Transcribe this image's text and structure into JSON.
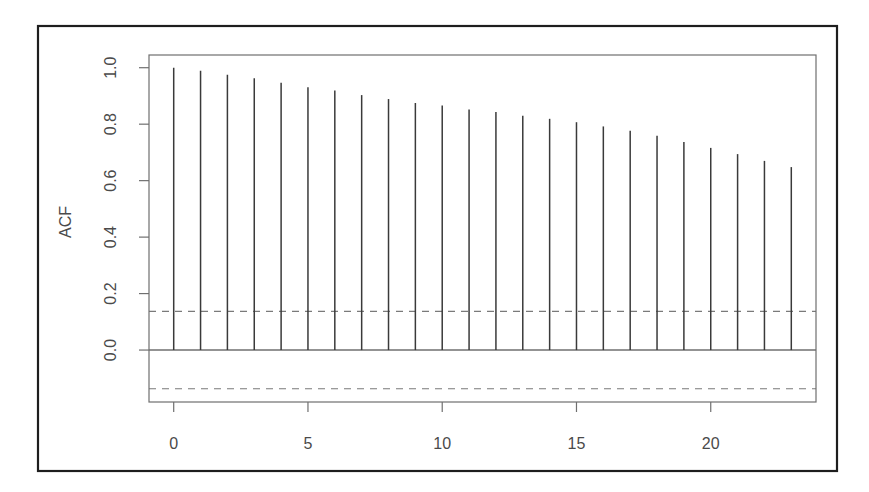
{
  "chart_data": {
    "type": "bar",
    "subtype": "acf-correlogram",
    "title": "",
    "xlabel": "",
    "ylabel": "ACF",
    "x": [
      0,
      1,
      2,
      3,
      4,
      5,
      6,
      7,
      8,
      9,
      10,
      11,
      12,
      13,
      14,
      15,
      16,
      17,
      18,
      19,
      20,
      21,
      22,
      23
    ],
    "values": [
      1.0,
      0.989,
      0.975,
      0.963,
      0.947,
      0.931,
      0.919,
      0.903,
      0.889,
      0.875,
      0.866,
      0.852,
      0.843,
      0.83,
      0.819,
      0.807,
      0.792,
      0.777,
      0.759,
      0.737,
      0.716,
      0.694,
      0.67,
      0.648
    ],
    "confidence_bounds": [
      0.137,
      -0.137
    ],
    "zero_line": 0.0,
    "xlim": [
      -0.92,
      23.92
    ],
    "ylim": [
      -0.184,
      1.045
    ],
    "xticks": [
      0,
      5,
      10,
      15,
      20
    ],
    "xtick_labels": [
      "0",
      "5",
      "10",
      "15",
      "20"
    ],
    "yticks": [
      0.0,
      0.2,
      0.4,
      0.6,
      0.8,
      1.0
    ],
    "ytick_labels": [
      "0.0",
      "0.2",
      "0.4",
      "0.6",
      "0.8",
      "1.0"
    ],
    "grid": false,
    "legend": null,
    "colors": {
      "bars": "#3a3a3a",
      "axes": "#6f6f6f",
      "ci_lines": "#7a7a7a",
      "outer_frame": "#1e1e1e",
      "text": "#4a4a4a"
    }
  }
}
